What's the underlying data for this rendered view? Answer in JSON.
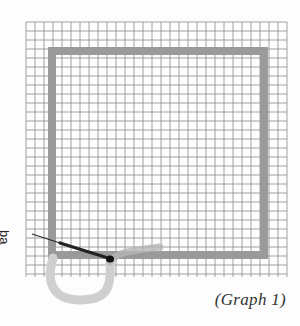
{
  "figure": {
    "caption": "(Graph 1)",
    "point_label": "ba",
    "grid": {
      "left": 26,
      "top": 22,
      "right": 287,
      "bottom": 277,
      "spacing": 9,
      "color": "#8a8a8a"
    },
    "square": {
      "x": 48,
      "y": 47,
      "size": 212,
      "band": 8,
      "color": "#9a9a9a"
    },
    "loop_color": "#cfcfcf",
    "needle_color": "#222222"
  }
}
